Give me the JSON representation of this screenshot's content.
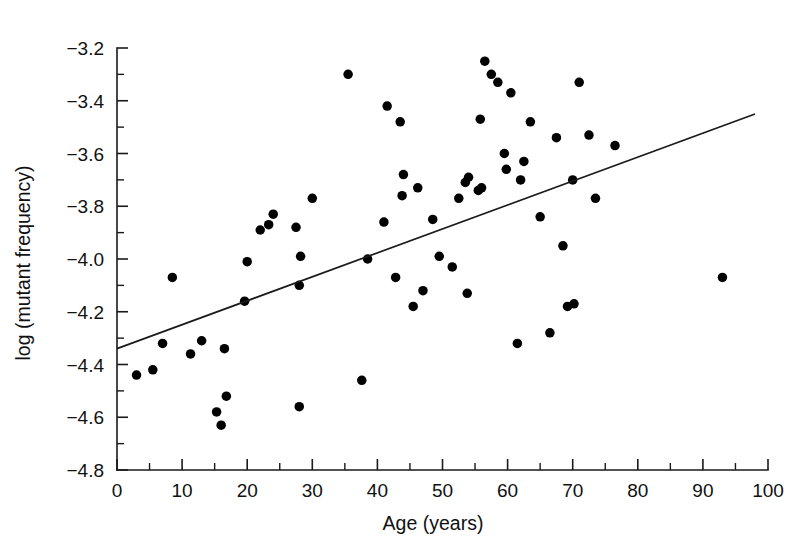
{
  "chart_data": {
    "type": "scatter",
    "title": "",
    "xlabel": "Age (years)",
    "ylabel": "log (mutant frequency)",
    "xlim": [
      0,
      100
    ],
    "ylim": [
      -4.8,
      -3.2
    ],
    "x_major_ticks": [
      0,
      10,
      20,
      30,
      40,
      50,
      60,
      70,
      80,
      90,
      100
    ],
    "x_minor_step": 5,
    "y_major_ticks": [
      -3.2,
      -3.4,
      -3.6,
      -3.8,
      -4.0,
      -4.2,
      -4.4,
      -4.6,
      -4.8
    ],
    "y_tick_labels": [
      "−3.2",
      "−3.4",
      "−3.6",
      "−3.8",
      "−4.0",
      "−4.2",
      "−4.4",
      "−4.6",
      "−4.8"
    ],
    "x_tick_labels": [
      "0",
      "10",
      "20",
      "30",
      "40",
      "50",
      "60",
      "70",
      "80",
      "90",
      "100"
    ],
    "y_minor_step": 0.1,
    "grid": false,
    "legend": false,
    "marker": {
      "shape": "circle",
      "color": "#000000",
      "size_px": 9.5
    },
    "points": [
      {
        "x": 3.0,
        "y": -4.44
      },
      {
        "x": 5.5,
        "y": -4.42
      },
      {
        "x": 7.0,
        "y": -4.32
      },
      {
        "x": 8.5,
        "y": -4.07
      },
      {
        "x": 11.3,
        "y": -4.36
      },
      {
        "x": 13.0,
        "y": -4.31
      },
      {
        "x": 15.3,
        "y": -4.58
      },
      {
        "x": 16.0,
        "y": -4.63
      },
      {
        "x": 16.8,
        "y": -4.52
      },
      {
        "x": 16.5,
        "y": -4.34
      },
      {
        "x": 19.6,
        "y": -4.16
      },
      {
        "x": 20.0,
        "y": -4.01
      },
      {
        "x": 22.0,
        "y": -3.89
      },
      {
        "x": 23.3,
        "y": -3.87
      },
      {
        "x": 24.0,
        "y": -3.83
      },
      {
        "x": 27.5,
        "y": -3.88
      },
      {
        "x": 28.0,
        "y": -4.1
      },
      {
        "x": 28.2,
        "y": -3.99
      },
      {
        "x": 28.0,
        "y": -4.56
      },
      {
        "x": 30.0,
        "y": -3.77
      },
      {
        "x": 35.5,
        "y": -3.3
      },
      {
        "x": 37.6,
        "y": -4.46
      },
      {
        "x": 38.5,
        "y": -4.0
      },
      {
        "x": 41.5,
        "y": -3.42
      },
      {
        "x": 41.0,
        "y": -3.86
      },
      {
        "x": 42.8,
        "y": -4.07
      },
      {
        "x": 43.5,
        "y": -3.48
      },
      {
        "x": 43.8,
        "y": -3.76
      },
      {
        "x": 44.0,
        "y": -3.68
      },
      {
        "x": 45.5,
        "y": -4.18
      },
      {
        "x": 46.2,
        "y": -3.73
      },
      {
        "x": 47.0,
        "y": -4.12
      },
      {
        "x": 48.5,
        "y": -3.85
      },
      {
        "x": 49.5,
        "y": -3.99
      },
      {
        "x": 51.5,
        "y": -4.03
      },
      {
        "x": 52.5,
        "y": -3.77
      },
      {
        "x": 53.5,
        "y": -3.71
      },
      {
        "x": 54.0,
        "y": -3.69
      },
      {
        "x": 53.8,
        "y": -4.13
      },
      {
        "x": 55.5,
        "y": -3.74
      },
      {
        "x": 55.8,
        "y": -3.47
      },
      {
        "x": 56.0,
        "y": -3.73
      },
      {
        "x": 56.5,
        "y": -3.25
      },
      {
        "x": 57.5,
        "y": -3.3
      },
      {
        "x": 58.5,
        "y": -3.33
      },
      {
        "x": 59.5,
        "y": -3.6
      },
      {
        "x": 59.8,
        "y": -3.66
      },
      {
        "x": 60.5,
        "y": -3.37
      },
      {
        "x": 61.5,
        "y": -4.32
      },
      {
        "x": 62.0,
        "y": -3.7
      },
      {
        "x": 62.5,
        "y": -3.63
      },
      {
        "x": 63.5,
        "y": -3.48
      },
      {
        "x": 65.0,
        "y": -3.84
      },
      {
        "x": 66.5,
        "y": -4.28
      },
      {
        "x": 67.5,
        "y": -3.54
      },
      {
        "x": 68.5,
        "y": -3.95
      },
      {
        "x": 69.2,
        "y": -4.18
      },
      {
        "x": 70.2,
        "y": -4.17
      },
      {
        "x": 70.0,
        "y": -3.7
      },
      {
        "x": 71.0,
        "y": -3.33
      },
      {
        "x": 72.5,
        "y": -3.53
      },
      {
        "x": 73.5,
        "y": -3.77
      },
      {
        "x": 76.5,
        "y": -3.57
      },
      {
        "x": 93.0,
        "y": -4.07
      }
    ],
    "trend_line": {
      "type": "linear-fit",
      "x_start": 0.0,
      "y_start": -4.34,
      "x_end": 98.0,
      "y_end": -3.45
    }
  }
}
